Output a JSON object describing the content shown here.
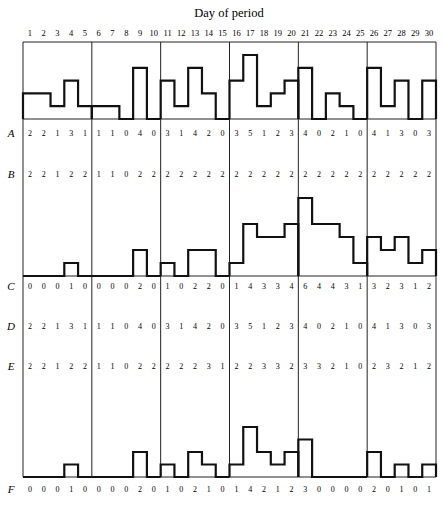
{
  "figure": {
    "title": "Day of period",
    "days": [
      1,
      2,
      3,
      4,
      5,
      6,
      7,
      8,
      9,
      10,
      11,
      12,
      13,
      14,
      15,
      16,
      17,
      18,
      19,
      20,
      21,
      22,
      23,
      24,
      25,
      26,
      27,
      28,
      29,
      30
    ],
    "row_labels": [
      "A",
      "B",
      "C",
      "D",
      "E",
      "F"
    ]
  },
  "chart_data": {
    "type": "table",
    "title": "Day of period",
    "xlabel": "Day of period",
    "x": [
      1,
      2,
      3,
      4,
      5,
      6,
      7,
      8,
      9,
      10,
      11,
      12,
      13,
      14,
      15,
      16,
      17,
      18,
      19,
      20,
      21,
      22,
      23,
      24,
      25,
      26,
      27,
      28,
      29,
      30
    ],
    "panels": 6,
    "days_per_panel": 5,
    "grid": false,
    "series": [
      {
        "name": "A",
        "values": [
          2,
          2,
          1,
          3,
          1,
          1,
          1,
          0,
          4,
          0,
          3,
          1,
          4,
          2,
          0,
          3,
          5,
          1,
          2,
          3,
          4,
          0,
          2,
          1,
          0,
          4,
          1,
          3,
          0,
          3
        ],
        "histogram": "top"
      },
      {
        "name": "B",
        "values": [
          2,
          2,
          1,
          2,
          2,
          1,
          1,
          0,
          2,
          2,
          2,
          2,
          2,
          2,
          2,
          2,
          2,
          2,
          2,
          2,
          2,
          2,
          2,
          2,
          2,
          2,
          2,
          2,
          2,
          2
        ]
      },
      {
        "name": "C",
        "values": [
          0,
          0,
          0,
          1,
          0,
          0,
          0,
          0,
          2,
          0,
          1,
          0,
          2,
          2,
          0,
          1,
          4,
          3,
          3,
          4,
          6,
          4,
          4,
          3,
          1,
          3,
          2,
          3,
          1,
          2
        ],
        "histogram": "middle"
      },
      {
        "name": "D",
        "values": [
          2,
          2,
          1,
          3,
          1,
          1,
          1,
          0,
          4,
          0,
          3,
          1,
          4,
          2,
          0,
          3,
          5,
          1,
          2,
          3,
          4,
          0,
          2,
          1,
          0,
          4,
          1,
          3,
          0,
          3
        ]
      },
      {
        "name": "E",
        "values": [
          2,
          2,
          1,
          2,
          2,
          1,
          1,
          0,
          2,
          2,
          2,
          2,
          2,
          3,
          1,
          2,
          2,
          3,
          3,
          2,
          3,
          3,
          2,
          1,
          0,
          2,
          3,
          2,
          1,
          2
        ]
      },
      {
        "name": "F",
        "values": [
          0,
          0,
          0,
          1,
          0,
          0,
          0,
          0,
          2,
          0,
          1,
          0,
          2,
          1,
          0,
          1,
          4,
          2,
          1,
          2,
          3,
          0,
          0,
          0,
          0,
          2,
          0,
          1,
          0,
          1
        ],
        "histogram": "bottom"
      }
    ]
  }
}
